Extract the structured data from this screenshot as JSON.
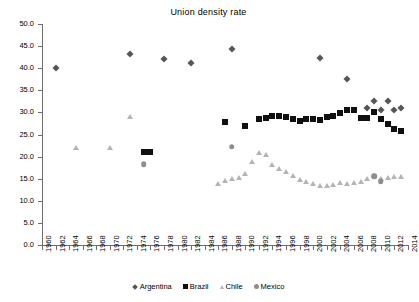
{
  "chart_data": {
    "type": "scatter",
    "title": "Union density rate",
    "xlabel": "",
    "ylabel": "",
    "xlim": [
      1960,
      2014
    ],
    "ylim": [
      0,
      50
    ],
    "grid": false,
    "legend_position": "bottom",
    "y_ticks": [
      "0.0",
      "5.0",
      "10.0",
      "15.0",
      "20.0",
      "25.0",
      "30.0",
      "35.0",
      "40.0",
      "45.0",
      "50.0"
    ],
    "x_ticks": [
      "1960",
      "1962",
      "1964",
      "1966",
      "1968",
      "1970",
      "1972",
      "1974",
      "1976",
      "1978",
      "1980",
      "1982",
      "1984",
      "1986",
      "1988",
      "1990",
      "1992",
      "1994",
      "1996",
      "1998",
      "2000",
      "2002",
      "2004",
      "2006",
      "2008",
      "2010",
      "2012",
      "2014"
    ],
    "series": [
      {
        "name": "Argentina",
        "marker": "diamond",
        "color": "#565656",
        "points": [
          [
            1962,
            40.0
          ],
          [
            1973,
            43.1
          ],
          [
            1978,
            42.1
          ],
          [
            1982,
            41.2
          ],
          [
            1988,
            44.3
          ],
          [
            2001,
            42.4
          ],
          [
            2005,
            37.5
          ],
          [
            2008,
            31.0
          ],
          [
            2009,
            32.6
          ],
          [
            2010,
            30.6
          ],
          [
            2011,
            32.5
          ],
          [
            2012,
            30.6
          ],
          [
            2013,
            31.1
          ]
        ]
      },
      {
        "name": "Brazil",
        "marker": "square",
        "color": "#101010",
        "points": [
          [
            1975,
            21.0
          ],
          [
            1976,
            21.0
          ],
          [
            1987,
            27.9
          ],
          [
            1990,
            26.9
          ],
          [
            1992,
            28.6
          ],
          [
            1993,
            28.8
          ],
          [
            1994,
            29.1
          ],
          [
            1995,
            29.2
          ],
          [
            1996,
            29.0
          ],
          [
            1997,
            28.6
          ],
          [
            1998,
            28.1
          ],
          [
            1999,
            28.6
          ],
          [
            2000,
            28.5
          ],
          [
            2001,
            28.3
          ],
          [
            2002,
            29.0
          ],
          [
            2003,
            29.2
          ],
          [
            2004,
            29.9
          ],
          [
            2005,
            30.5
          ],
          [
            2006,
            30.6
          ],
          [
            2007,
            28.7
          ],
          [
            2008,
            28.8
          ],
          [
            2009,
            30.1
          ],
          [
            2010,
            28.5
          ],
          [
            2011,
            27.3
          ],
          [
            2012,
            26.2
          ],
          [
            2013,
            25.7
          ]
        ]
      },
      {
        "name": "Chile",
        "marker": "triangle",
        "color": "#b4b4b4",
        "points": [
          [
            1965,
            21.9
          ],
          [
            1970,
            21.9
          ],
          [
            1973,
            28.9
          ],
          [
            1986,
            13.9
          ],
          [
            1987,
            14.5
          ],
          [
            1988,
            15.0
          ],
          [
            1989,
            15.2
          ],
          [
            1990,
            16.1
          ],
          [
            1991,
            18.7
          ],
          [
            1992,
            20.8
          ],
          [
            1993,
            20.4
          ],
          [
            1994,
            18.2
          ],
          [
            1995,
            17.3
          ],
          [
            1996,
            16.5
          ],
          [
            1997,
            15.6
          ],
          [
            1998,
            14.7
          ],
          [
            1999,
            14.3
          ],
          [
            2000,
            13.7
          ],
          [
            2001,
            13.3
          ],
          [
            2002,
            13.3
          ],
          [
            2003,
            13.6
          ],
          [
            2004,
            14.1
          ],
          [
            2005,
            13.8
          ],
          [
            2006,
            14.0
          ],
          [
            2007,
            14.3
          ],
          [
            2008,
            15.0
          ],
          [
            2009,
            15.7
          ],
          [
            2010,
            15.0
          ],
          [
            2011,
            15.2
          ],
          [
            2012,
            15.4
          ],
          [
            2013,
            15.3
          ]
        ]
      },
      {
        "name": "Mexico",
        "marker": "circle",
        "color": "#8e8e8e",
        "points": [
          [
            1975,
            18.3
          ],
          [
            1988,
            22.2
          ],
          [
            2009,
            15.5
          ],
          [
            2010,
            14.5
          ]
        ]
      }
    ]
  },
  "legend": {
    "items": [
      {
        "label": "Argentina",
        "marker": "diamond"
      },
      {
        "label": "Brazil",
        "marker": "square"
      },
      {
        "label": "Chile",
        "marker": "triangle"
      },
      {
        "label": "Mexico",
        "marker": "circle"
      }
    ]
  },
  "colors": {
    "argentina": "#565656",
    "brazil": "#101010",
    "chile": "#b4b4b4",
    "mexico": "#8e8e8e",
    "axis": "#6d6d6d",
    "background": "#ffffff"
  }
}
